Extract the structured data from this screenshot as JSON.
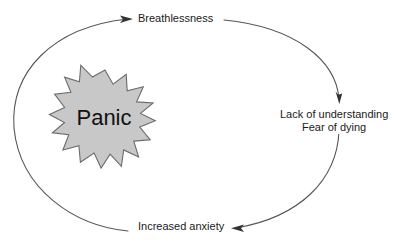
{
  "diagram": {
    "type": "cycle-flow-diagram",
    "background_color": "#ffffff",
    "stroke_color": "#555555",
    "text_color": "#1a1a1a",
    "center": {
      "shape": "starburst",
      "points": 16,
      "label": "Panic",
      "fill_color": "#c8c8c8",
      "stroke_color": "#6b6b6b"
    },
    "nodes": [
      {
        "id": "breathlessness",
        "label": "Breathlessness",
        "position": "top"
      },
      {
        "id": "understanding",
        "label_line1": "Lack of understanding",
        "label_line2": "Fear of dying",
        "position": "right"
      },
      {
        "id": "anxiety",
        "label": "Increased anxiety",
        "position": "bottom"
      }
    ],
    "arrows": [
      {
        "id": "arrow-to-breathlessness",
        "from": "anxiety",
        "to": "breathlessness",
        "direction": "clockwise-left-up"
      },
      {
        "id": "arrow-to-understanding",
        "from": "breathlessness",
        "to": "understanding",
        "direction": "clockwise-right-down"
      },
      {
        "id": "arrow-to-anxiety",
        "from": "understanding",
        "to": "anxiety",
        "direction": "clockwise-down-left"
      }
    ]
  }
}
